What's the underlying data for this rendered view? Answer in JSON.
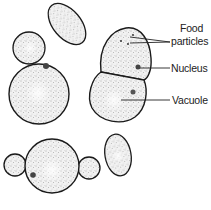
{
  "diagram": {
    "labels": [
      {
        "id": "food-particles",
        "line1": "Food",
        "line2": "particles"
      },
      {
        "id": "nucleus",
        "text": "Nucleus"
      },
      {
        "id": "vacuole",
        "text": "Vacuole"
      }
    ],
    "caption": "",
    "colors": {
      "outline": "#1a1a1a",
      "stipple": "#555555",
      "background": "#ffffff",
      "text": "#222222"
    }
  }
}
